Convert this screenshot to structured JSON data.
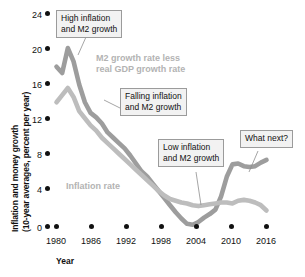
{
  "chart_data": {
    "type": "line",
    "title": "",
    "xlabel": "Year",
    "ylabel": "Inflation and money growth (10-year averages, percent per year)",
    "ylabel_line1": "Inflation and money growth",
    "ylabel_line2": "(10-year averages, percent per year)",
    "xlim": [
      1979,
      2016
    ],
    "ylim": [
      0,
      24
    ],
    "grid": false,
    "legend_position": "inline-labels",
    "yticks": [
      0,
      4,
      8,
      12,
      16,
      20,
      24
    ],
    "ytick_labels": [
      "0",
      "4",
      "8",
      "12",
      "16",
      "20",
      "24"
    ],
    "xticks": [
      1980,
      1986,
      1992,
      1998,
      2004,
      2010,
      2016
    ],
    "xtick_labels": [
      "1980",
      "1986",
      "1992",
      "1998",
      "2004",
      "2010",
      "2016"
    ],
    "series": [
      {
        "name": "M2 growth rate less real GDP growth rate",
        "color": "#9d9d9d",
        "x": [
          1979,
          1980,
          1981,
          1982,
          1983,
          1984,
          1985,
          1986,
          1987,
          1988,
          1989,
          1990,
          1991,
          1992,
          1993,
          1994,
          1995,
          1996,
          1997,
          1998,
          1999,
          2000,
          2001,
          2002,
          2003,
          2004,
          2005,
          2006,
          2007,
          2008,
          2009,
          2010,
          2011,
          2012,
          2013,
          2014,
          2015,
          2016
        ],
        "values": [
          18.0,
          17.3,
          20.1,
          18.6,
          16.0,
          14.0,
          12.8,
          12.3,
          11.6,
          10.6,
          10.0,
          9.4,
          8.8,
          8.0,
          7.1,
          6.2,
          5.6,
          4.8,
          4.0,
          3.2,
          2.4,
          1.6,
          0.9,
          0.3,
          0.2,
          0.5,
          1.0,
          1.4,
          1.9,
          3.4,
          5.6,
          7.0,
          7.1,
          6.8,
          6.7,
          6.8,
          7.2,
          7.5
        ]
      },
      {
        "name": "Inflation rate",
        "color": "#bdbdbd",
        "x": [
          1979,
          1980,
          1981,
          1982,
          1983,
          1984,
          1985,
          1986,
          1987,
          1988,
          1989,
          1990,
          1991,
          1992,
          1993,
          1994,
          1995,
          1996,
          1997,
          1998,
          1999,
          2000,
          2001,
          2002,
          2003,
          2004,
          2005,
          2006,
          2007,
          2008,
          2009,
          2010,
          2011,
          2012,
          2013,
          2014,
          2015,
          2016
        ],
        "values": [
          14.0,
          14.8,
          15.6,
          14.6,
          13.0,
          12.2,
          11.4,
          10.8,
          10.0,
          9.4,
          8.8,
          8.2,
          7.6,
          7.0,
          6.4,
          5.8,
          5.2,
          4.6,
          4.0,
          3.5,
          3.1,
          2.9,
          2.7,
          2.6,
          2.4,
          2.3,
          2.4,
          2.5,
          2.6,
          2.7,
          2.7,
          2.6,
          2.9,
          3.0,
          2.9,
          2.7,
          2.4,
          1.8
        ]
      }
    ],
    "annotations": [
      {
        "id": "high-inflation",
        "text_line1": "High inflation",
        "text_line2": "and M2 growth"
      },
      {
        "id": "falling-inflation",
        "text_line1": "Falling inflation",
        "text_line2": "and M2 growth"
      },
      {
        "id": "low-inflation",
        "text_line1": "Low inflation",
        "text_line2": "and M2 growth"
      },
      {
        "id": "what-next",
        "text_line1": "What next?",
        "text_line2": ""
      }
    ],
    "series_labels": [
      {
        "id": "m2-label",
        "text_line1": "M2 growth rate less",
        "text_line2": "real GDP growth rate"
      },
      {
        "id": "inflation-label",
        "text_line1": "Inflation rate",
        "text_line2": ""
      }
    ]
  },
  "caption": ""
}
